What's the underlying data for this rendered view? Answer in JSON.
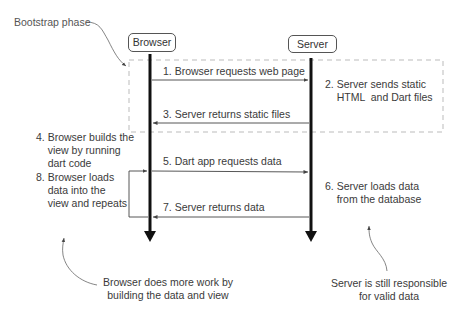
{
  "diagram": {
    "phase_label": "Bootstrap phase",
    "actors": [
      {
        "name": "Browser"
      },
      {
        "name": "Server"
      }
    ],
    "messages": [
      {
        "step": 1,
        "label": "1. Browser requests web page",
        "from": "Browser",
        "to": "Server"
      },
      {
        "step": 3,
        "label": "3. Server returns static files",
        "from": "Server",
        "to": "Browser"
      },
      {
        "step": 5,
        "label": "5. Dart app requests data",
        "from": "Browser",
        "to": "Server"
      },
      {
        "step": 7,
        "label": "7. Server returns data",
        "from": "Server",
        "to": "Browser"
      }
    ],
    "notes": {
      "step2": "2. Server sends static\n    HTML  and Dart files",
      "step4": "4. Browser builds the\n    view by running\n    dart code",
      "step6": "6. Server loads data\n    from the database",
      "step8": "8. Browser loads\n    data into the\n    view and repeats"
    },
    "callouts": {
      "browser": "Browser does more work by\nbuilding the data and view",
      "server": "Server is still responsible\nfor valid data"
    }
  }
}
